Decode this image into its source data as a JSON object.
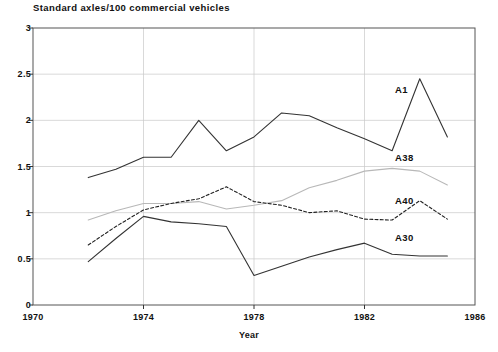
{
  "chart_data": {
    "type": "line",
    "title": "Standard axles/100 commercial vehicles",
    "xlabel": "Year",
    "ylabel": "",
    "xlim": [
      1970,
      1986
    ],
    "ylim": [
      0,
      3
    ],
    "xticks": [
      "1970",
      "1974",
      "1978",
      "1982",
      "1986"
    ],
    "xtick_values": [
      1970,
      1974,
      1978,
      1982,
      1986
    ],
    "yticks": [
      "0",
      "0.5",
      "1",
      "1.5",
      "2",
      "2.5",
      "3"
    ],
    "ytick_values": [
      0,
      0.5,
      1,
      1.5,
      2,
      2.5,
      3
    ],
    "grid": true,
    "legend_position": "inline-right",
    "x": [
      1972,
      1973,
      1974,
      1975,
      1976,
      1977,
      1978,
      1979,
      1980,
      1981,
      1982,
      1983,
      1984,
      1985
    ],
    "series": [
      {
        "name": "A1",
        "style": "solid",
        "color": "#333333",
        "label_x": 1983.1,
        "label_y": 2.33,
        "values": [
          1.38,
          1.47,
          1.6,
          1.6,
          2.0,
          1.67,
          1.82,
          2.08,
          2.05,
          1.92,
          1.8,
          1.67,
          2.45,
          1.82
        ]
      },
      {
        "name": "A38",
        "style": "solid",
        "color": "#b8b8b8",
        "label_x": 1983.1,
        "label_y": 1.59,
        "values": [
          0.92,
          1.02,
          1.1,
          1.1,
          1.12,
          1.04,
          1.08,
          1.13,
          1.27,
          1.35,
          1.45,
          1.48,
          1.45,
          1.3
        ]
      },
      {
        "name": "A40",
        "style": "dashed",
        "color": "#222222",
        "label_x": 1983.1,
        "label_y": 1.13,
        "values": [
          0.65,
          0.85,
          1.03,
          1.1,
          1.15,
          1.28,
          1.12,
          1.08,
          1.0,
          1.02,
          0.93,
          0.92,
          1.13,
          0.93
        ]
      },
      {
        "name": "A30",
        "style": "solid",
        "color": "#333333",
        "label_x": 1983.1,
        "label_y": 0.73,
        "values": [
          0.47,
          0.72,
          0.96,
          0.9,
          0.88,
          0.85,
          0.32,
          0.42,
          0.52,
          0.6,
          0.67,
          0.55,
          0.53,
          0.53
        ]
      }
    ],
    "series_extra_note": {
      "A30_tail": [
        1985,
        0.7
      ]
    }
  }
}
